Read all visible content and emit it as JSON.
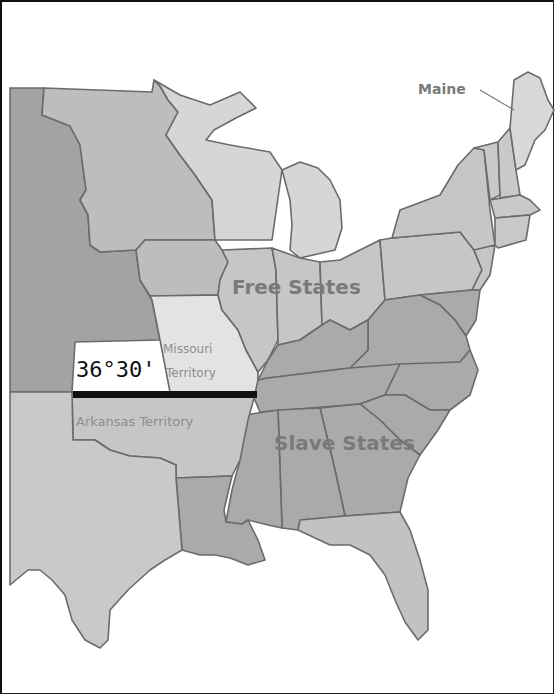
{
  "map": {
    "title_hint": "Missouri Compromise",
    "labels": {
      "maine": "Maine",
      "free_states": "Free States",
      "slave_states": "Slave States",
      "missouri_line1": "Missouri",
      "missouri_line2": "Territory",
      "arkansas": "Arkansas Territory",
      "latitude": "36°30'"
    },
    "colors": {
      "background": "#ffffff",
      "free_state_fill": "#c4c4c4",
      "light_fill": "#d9d9d9",
      "missouri_fill": "#e2e2e2",
      "slave_state_fill": "#a9a9a9",
      "territory_west_fill": "#a2a2a2",
      "texas_fill": "#c8c8c8",
      "border": "#6b6b6b",
      "compromise_line": "#111111",
      "label_text": "#7a7a7a"
    }
  }
}
